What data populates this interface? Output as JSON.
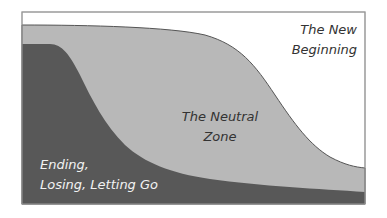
{
  "diagram": {
    "colors": {
      "background": "#ffffff",
      "frame": "#888888",
      "neutral_zone": "#b8b8b8",
      "ending": "#585858",
      "outline": "#555555"
    },
    "regions": [
      {
        "id": "new_beginning",
        "lines": [
          "The New",
          "Beginning"
        ]
      },
      {
        "id": "neutral_zone",
        "lines": [
          "The Neutral",
          "Zone"
        ]
      },
      {
        "id": "ending",
        "lines": [
          "Ending,",
          "Losing, Letting Go"
        ]
      }
    ]
  }
}
